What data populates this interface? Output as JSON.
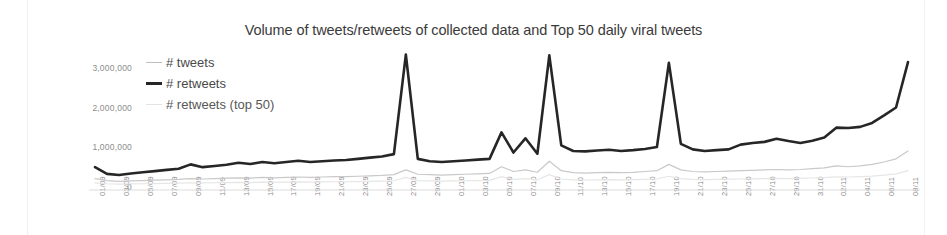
{
  "chart_data": {
    "type": "line",
    "title": "Volume of tweets/retweets of collected data and Top 50 daily viral tweets",
    "xlabel": "",
    "ylabel": "",
    "ylim": [
      0,
      3500000
    ],
    "yticks": [
      0,
      1000000,
      2000000,
      3000000
    ],
    "ytick_labels": [
      "0",
      "1,000,000",
      "2,000,000",
      "3,000,000"
    ],
    "grid": false,
    "legend_position": "top-left-inside",
    "categories": [
      "01/09",
      "02/09",
      "03/09",
      "04/09",
      "05/09",
      "06/09",
      "07/09",
      "08/09",
      "09/09",
      "10/09",
      "11/09",
      "12/09",
      "13/09",
      "14/09",
      "15/09",
      "16/09",
      "17/09",
      "18/09",
      "19/09",
      "20/09",
      "21/09",
      "22/09",
      "23/09",
      "24/09",
      "25/09",
      "26/09",
      "27/09",
      "28/09",
      "29/09",
      "30/09",
      "01/10",
      "02/10",
      "03/10",
      "04/10",
      "05/10",
      "06/10",
      "07/10",
      "08/10",
      "09/10",
      "10/10",
      "11/10",
      "12/10",
      "13/10",
      "14/10",
      "15/10",
      "16/10",
      "17/10",
      "18/10",
      "19/10",
      "20/10",
      "21/10",
      "22/10",
      "23/10",
      "24/10",
      "25/10",
      "26/10",
      "27/10",
      "28/10",
      "29/10",
      "30/10",
      "31/10",
      "01/11",
      "02/11",
      "03/11",
      "04/11",
      "05/11",
      "06/11",
      "07/11",
      "08/11"
    ],
    "xtick_labels": [
      "01/09",
      "03/09",
      "05/09",
      "07/09",
      "09/09",
      "11/09",
      "13/09",
      "15/09",
      "17/09",
      "19/09",
      "21/09",
      "23/09",
      "25/09",
      "27/09",
      "29/09",
      "01/10",
      "03/10",
      "05/10",
      "07/10",
      "09/10",
      "11/10",
      "13/10",
      "15/10",
      "17/10",
      "19/10",
      "21/10",
      "23/10",
      "25/10",
      "27/10",
      "29/10",
      "31/10",
      "02/11",
      "04/11",
      "06/11",
      "08/11"
    ],
    "series": [
      {
        "name": "# tweets",
        "color": "#c9c9c9",
        "width": 1.2,
        "values": [
          200000,
          150000,
          130000,
          140000,
          150000,
          160000,
          170000,
          180000,
          200000,
          190000,
          200000,
          210000,
          220000,
          210000,
          230000,
          220000,
          230000,
          240000,
          230000,
          240000,
          250000,
          250000,
          260000,
          270000,
          280000,
          300000,
          420000,
          310000,
          300000,
          290000,
          300000,
          310000,
          320000,
          330000,
          500000,
          380000,
          420000,
          360000,
          640000,
          400000,
          350000,
          340000,
          350000,
          360000,
          350000,
          360000,
          380000,
          400000,
          560000,
          420000,
          380000,
          370000,
          380000,
          390000,
          400000,
          410000,
          420000,
          430000,
          420000,
          430000,
          450000,
          470000,
          520000,
          500000,
          520000,
          560000,
          620000,
          700000,
          900000
        ]
      },
      {
        "name": "# retweets",
        "color": "#262626",
        "width": 2.6,
        "values": [
          490000,
          320000,
          290000,
          330000,
          360000,
          390000,
          420000,
          450000,
          560000,
          490000,
          520000,
          550000,
          600000,
          570000,
          620000,
          590000,
          620000,
          650000,
          620000,
          640000,
          660000,
          670000,
          700000,
          730000,
          760000,
          820000,
          3340000,
          700000,
          640000,
          620000,
          640000,
          660000,
          680000,
          700000,
          1370000,
          860000,
          1220000,
          830000,
          3320000,
          1040000,
          900000,
          890000,
          910000,
          930000,
          900000,
          920000,
          950000,
          1000000,
          3130000,
          1080000,
          940000,
          900000,
          920000,
          940000,
          1060000,
          1100000,
          1130000,
          1210000,
          1150000,
          1100000,
          1160000,
          1240000,
          1490000,
          1480000,
          1510000,
          1610000,
          1800000,
          2000000,
          3150000
        ]
      },
      {
        "name": "# retweets (top 50)",
        "color": "#e6e6e6",
        "width": 1.2,
        "values": [
          90000,
          70000,
          60000,
          65000,
          70000,
          75000,
          80000,
          85000,
          95000,
          90000,
          95000,
          100000,
          105000,
          100000,
          110000,
          105000,
          110000,
          115000,
          110000,
          115000,
          120000,
          120000,
          125000,
          130000,
          135000,
          145000,
          230000,
          150000,
          140000,
          135000,
          140000,
          145000,
          150000,
          155000,
          250000,
          180000,
          200000,
          170000,
          300000,
          190000,
          170000,
          165000,
          170000,
          175000,
          170000,
          175000,
          180000,
          190000,
          260000,
          200000,
          180000,
          175000,
          180000,
          185000,
          190000,
          195000,
          200000,
          205000,
          200000,
          205000,
          215000,
          225000,
          245000,
          240000,
          250000,
          265000,
          290000,
          320000,
          400000
        ]
      }
    ]
  }
}
